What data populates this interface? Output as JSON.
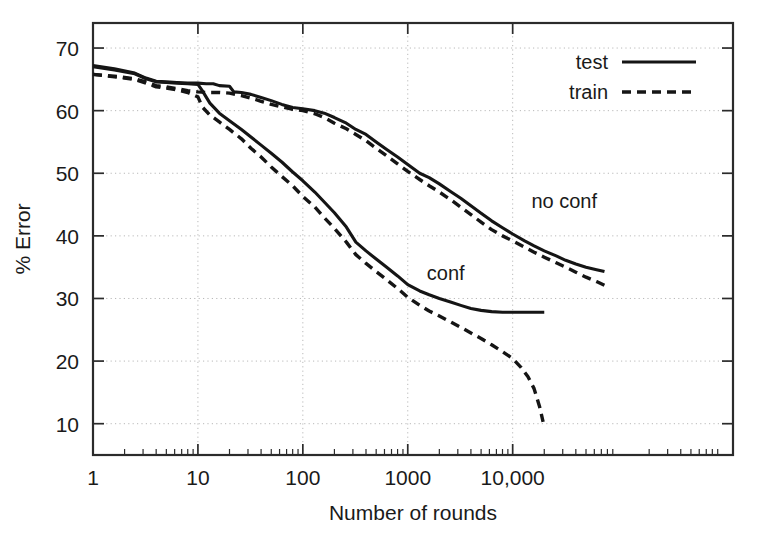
{
  "chart_data": {
    "type": "line",
    "title": "",
    "xlabel": "Number of rounds",
    "ylabel": "% Error",
    "xscale": "log",
    "yscale": "linear",
    "xlim": [
      1,
      1258925
    ],
    "ylim": [
      5,
      74
    ],
    "grid": true,
    "x_tick_labels": [
      "1",
      "10",
      "100",
      "1000",
      "10,000"
    ],
    "x_tick_values": [
      1,
      10,
      100,
      1000,
      10000
    ],
    "y_tick_labels": [
      "10",
      "20",
      "30",
      "40",
      "50",
      "60",
      "70"
    ],
    "y_tick_values": [
      10,
      20,
      30,
      40,
      50,
      60,
      70
    ],
    "legend": {
      "position": "top-right",
      "entries": [
        {
          "label": "test",
          "style": "solid"
        },
        {
          "label": "train",
          "style": "dashed"
        }
      ]
    },
    "annotations": [
      {
        "text": "no conf",
        "x": 31000,
        "y": 44.5
      },
      {
        "text": "conf",
        "x": 2300,
        "y": 33.0
      }
    ],
    "series": [
      {
        "name": "no conf test",
        "group": "no conf",
        "style": "solid",
        "points": [
          [
            1,
            67.2
          ],
          [
            1.6,
            66.7
          ],
          [
            2.5,
            66.0
          ],
          [
            3.2,
            65.2
          ],
          [
            4.0,
            64.7
          ],
          [
            5.0,
            64.6
          ],
          [
            6.3,
            64.5
          ],
          [
            8.0,
            64.4
          ],
          [
            10,
            64.4
          ],
          [
            12,
            64.3
          ],
          [
            14,
            64.3
          ],
          [
            16,
            64.0
          ],
          [
            20,
            63.9
          ],
          [
            22,
            63.0
          ],
          [
            26,
            62.9
          ],
          [
            32,
            62.6
          ],
          [
            40,
            62.1
          ],
          [
            50,
            61.6
          ],
          [
            63,
            61.0
          ],
          [
            80,
            60.5
          ],
          [
            100,
            60.3
          ],
          [
            130,
            60.0
          ],
          [
            160,
            59.6
          ],
          [
            200,
            58.9
          ],
          [
            260,
            58.0
          ],
          [
            320,
            57.0
          ],
          [
            400,
            56.2
          ],
          [
            500,
            55.0
          ],
          [
            630,
            53.8
          ],
          [
            800,
            52.6
          ],
          [
            1000,
            51.4
          ],
          [
            1300,
            50.0
          ],
          [
            1600,
            49.3
          ],
          [
            2000,
            48.3
          ],
          [
            2600,
            47.0
          ],
          [
            3200,
            46.0
          ],
          [
            4000,
            44.8
          ],
          [
            5000,
            43.6
          ],
          [
            6300,
            42.4
          ],
          [
            8000,
            41.3
          ],
          [
            10000,
            40.3
          ],
          [
            13000,
            39.2
          ],
          [
            16000,
            38.4
          ],
          [
            20000,
            37.6
          ],
          [
            26000,
            36.8
          ],
          [
            32000,
            36.1
          ],
          [
            40000,
            35.5
          ],
          [
            50000,
            35.0
          ],
          [
            63000,
            34.6
          ],
          [
            75000,
            34.3
          ]
        ]
      },
      {
        "name": "no conf train",
        "group": "no conf",
        "style": "dashed",
        "points": [
          [
            1,
            65.8
          ],
          [
            1.6,
            65.5
          ],
          [
            2.5,
            65.1
          ],
          [
            3.2,
            64.6
          ],
          [
            4.0,
            64.0
          ],
          [
            5.0,
            63.8
          ],
          [
            6.3,
            63.5
          ],
          [
            8.0,
            63.2
          ],
          [
            10,
            63.0
          ],
          [
            12,
            62.9
          ],
          [
            14,
            62.9
          ],
          [
            16,
            62.9
          ],
          [
            20,
            62.8
          ],
          [
            26,
            62.4
          ],
          [
            32,
            62.0
          ],
          [
            40,
            61.5
          ],
          [
            50,
            61.0
          ],
          [
            63,
            60.6
          ],
          [
            80,
            60.2
          ],
          [
            100,
            60.0
          ],
          [
            130,
            59.5
          ],
          [
            160,
            58.9
          ],
          [
            200,
            58.0
          ],
          [
            260,
            57.1
          ],
          [
            320,
            56.2
          ],
          [
            400,
            55.2
          ],
          [
            500,
            54.0
          ],
          [
            630,
            52.8
          ],
          [
            800,
            51.5
          ],
          [
            1000,
            50.3
          ],
          [
            1300,
            49.0
          ],
          [
            1600,
            48.0
          ],
          [
            2000,
            47.0
          ],
          [
            2600,
            45.7
          ],
          [
            3200,
            44.6
          ],
          [
            4000,
            43.4
          ],
          [
            5000,
            42.2
          ],
          [
            6300,
            41.0
          ],
          [
            8000,
            40.0
          ],
          [
            10000,
            39.2
          ],
          [
            13000,
            38.2
          ],
          [
            16000,
            37.4
          ],
          [
            20000,
            36.6
          ],
          [
            26000,
            35.7
          ],
          [
            32000,
            35.0
          ],
          [
            40000,
            34.2
          ],
          [
            50000,
            33.4
          ],
          [
            63000,
            32.7
          ],
          [
            75000,
            32.1
          ]
        ]
      },
      {
        "name": "conf test",
        "group": "conf",
        "style": "solid",
        "points": [
          [
            1,
            67.0
          ],
          [
            1.6,
            66.5
          ],
          [
            2.5,
            65.9
          ],
          [
            3.2,
            65.1
          ],
          [
            4.0,
            64.6
          ],
          [
            5.0,
            64.5
          ],
          [
            6.3,
            64.4
          ],
          [
            8.0,
            64.3
          ],
          [
            10,
            64.2
          ],
          [
            11,
            63.2
          ],
          [
            13,
            61.2
          ],
          [
            16,
            59.6
          ],
          [
            20,
            58.4
          ],
          [
            26,
            57.0
          ],
          [
            32,
            55.8
          ],
          [
            40,
            54.5
          ],
          [
            50,
            53.2
          ],
          [
            63,
            51.8
          ],
          [
            80,
            50.2
          ],
          [
            100,
            48.8
          ],
          [
            130,
            47.0
          ],
          [
            160,
            45.4
          ],
          [
            200,
            43.7
          ],
          [
            260,
            41.4
          ],
          [
            320,
            39.0
          ],
          [
            400,
            37.6
          ],
          [
            500,
            36.3
          ],
          [
            630,
            35.0
          ],
          [
            800,
            33.6
          ],
          [
            1000,
            32.2
          ],
          [
            1300,
            31.2
          ],
          [
            1600,
            30.6
          ],
          [
            2000,
            30.0
          ],
          [
            2600,
            29.4
          ],
          [
            3200,
            28.9
          ],
          [
            4000,
            28.4
          ],
          [
            5000,
            28.1
          ],
          [
            6300,
            27.9
          ],
          [
            8000,
            27.8
          ],
          [
            10000,
            27.8
          ],
          [
            13000,
            27.8
          ],
          [
            16000,
            27.8
          ],
          [
            20000,
            27.8
          ]
        ]
      },
      {
        "name": "conf train",
        "group": "conf",
        "style": "dashed",
        "points": [
          [
            1,
            65.8
          ],
          [
            1.6,
            65.4
          ],
          [
            2.5,
            65.0
          ],
          [
            3.2,
            64.4
          ],
          [
            4.0,
            63.8
          ],
          [
            5.0,
            63.6
          ],
          [
            6.3,
            63.3
          ],
          [
            8.0,
            62.9
          ],
          [
            10,
            62.2
          ],
          [
            11,
            60.6
          ],
          [
            13,
            59.3
          ],
          [
            16,
            58.2
          ],
          [
            20,
            57.0
          ],
          [
            26,
            55.5
          ],
          [
            32,
            54.0
          ],
          [
            40,
            52.6
          ],
          [
            50,
            51.0
          ],
          [
            63,
            49.5
          ],
          [
            80,
            48.0
          ],
          [
            100,
            46.3
          ],
          [
            130,
            44.6
          ],
          [
            160,
            42.9
          ],
          [
            200,
            41.2
          ],
          [
            260,
            39.0
          ],
          [
            320,
            37.0
          ],
          [
            400,
            35.6
          ],
          [
            500,
            34.3
          ],
          [
            630,
            33.0
          ],
          [
            800,
            31.6
          ],
          [
            1000,
            30.2
          ],
          [
            1300,
            28.9
          ],
          [
            1600,
            28.0
          ],
          [
            2000,
            27.2
          ],
          [
            2600,
            26.2
          ],
          [
            3200,
            25.4
          ],
          [
            4000,
            24.5
          ],
          [
            5000,
            23.6
          ],
          [
            6300,
            22.6
          ],
          [
            8000,
            21.5
          ],
          [
            10000,
            20.4
          ],
          [
            12000,
            19.0
          ],
          [
            14000,
            17.5
          ],
          [
            16000,
            15.6
          ],
          [
            18000,
            12.8
          ],
          [
            19500,
            10.3
          ]
        ]
      }
    ]
  }
}
